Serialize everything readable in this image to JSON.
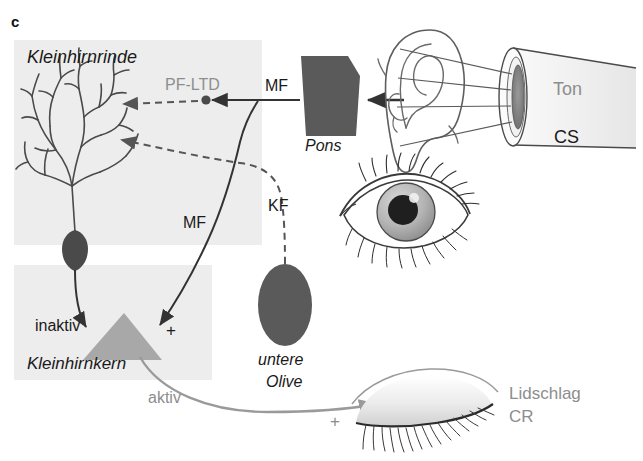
{
  "figure": {
    "panel_letter": "c",
    "type": "neuroanatomical-circuit-diagram",
    "topic": "Eyeblink conditioning cerebellar circuit"
  },
  "colors": {
    "page_background": "#ffffff",
    "shaded_box": "#ededed",
    "dark_structure": "#5a5a5a",
    "nucleus_triangle": "#a8a8a8",
    "gray_text": "#8d8d8d",
    "dark_text": "#1a1a1a",
    "black_pathway": "#333333",
    "gray_pathway": "#9a9a9a",
    "purkinje_line": "#4a4a4a"
  },
  "regions": {
    "cerebellar_cortex": {
      "label": "Kleinhirnrinde",
      "style": "italic",
      "box": {
        "x": 14,
        "y": 40,
        "w": 248,
        "h": 205
      }
    },
    "cerebellar_nucleus": {
      "label": "Kleinhirnkern",
      "style": "italic",
      "box": {
        "x": 14,
        "y": 265,
        "w": 198,
        "h": 115
      }
    }
  },
  "structures": [
    {
      "name": "purkinje-cell",
      "label": "",
      "note": "Purkinje neuron with branching dendritic tree and dark soma"
    },
    {
      "name": "pons",
      "label": "Pons",
      "style": "italic",
      "color": "#5a5a5a"
    },
    {
      "name": "inferior-olive",
      "label": "untere\nOlive",
      "label_line1": "untere",
      "label_line2": "Olive",
      "style": "italic",
      "color": "#5a5a5a"
    },
    {
      "name": "deep-cerebellar-nucleus-triangle",
      "label": "",
      "color": "#a8a8a8"
    },
    {
      "name": "ear",
      "label": "",
      "note": "outer ear pinna line drawing"
    },
    {
      "name": "open-eye",
      "label": "",
      "note": "open eye with iris and lashes"
    },
    {
      "name": "closed-eye",
      "label": "",
      "note": "closed eyelid with lashes"
    },
    {
      "name": "loudspeaker-cone",
      "label": "",
      "note": "sound source cone emitting tone"
    }
  ],
  "labels": {
    "panel": "c",
    "cortex": "Kleinhirnrinde",
    "nucleus": "Kleinhirnkern",
    "pons": "Pons",
    "olive_line1": "untere",
    "olive_line2": "Olive",
    "pf_ltd": "PF-LTD",
    "mf_top": "MF",
    "mf_mid": "MF",
    "kf": "KF",
    "inaktiv": "inaktiv",
    "aktiv": "aktiv",
    "plus_nucleus": "+",
    "plus_eyelid": "+",
    "ton": "Ton",
    "cs": "CS",
    "lidschlag_line1": "Lidschlag",
    "lidschlag_line2": "CR"
  },
  "pathways": [
    {
      "name": "parallel-fiber-ltd",
      "label": "PF-LTD",
      "style": "dashed",
      "color": "#555555",
      "from": "mossy-fiber-junction",
      "to": "purkinje-dendrite"
    },
    {
      "name": "mossy-fiber-from-pons",
      "label": "MF",
      "style": "solid",
      "color": "#333333",
      "from": "pons",
      "to": "junction"
    },
    {
      "name": "mossy-fiber-to-nucleus",
      "label": "MF",
      "style": "solid",
      "color": "#333333",
      "from": "junction",
      "to": "cerebellar-nucleus",
      "sign": "+"
    },
    {
      "name": "climbing-fiber",
      "label": "KF",
      "style": "dashed",
      "color": "#555555",
      "from": "inferior-olive",
      "to": "purkinje-dendrite"
    },
    {
      "name": "purkinje-to-nucleus-inactive",
      "label": "inaktiv",
      "style": "solid",
      "color": "#333333",
      "from": "purkinje-soma",
      "to": "cerebellar-nucleus"
    },
    {
      "name": "nucleus-to-eyelid-active",
      "label": "aktiv",
      "style": "solid",
      "color": "#9a9a9a",
      "from": "cerebellar-nucleus",
      "to": "closed-eye",
      "sign": "+"
    },
    {
      "name": "sound-to-ear",
      "style": "solid",
      "color": "#333333",
      "from": "ear",
      "to": "pons"
    }
  ],
  "stimulus": {
    "tone_label": "Ton",
    "cs_label": "CS",
    "response_label_line1": "Lidschlag",
    "response_label_line2": "CR"
  }
}
